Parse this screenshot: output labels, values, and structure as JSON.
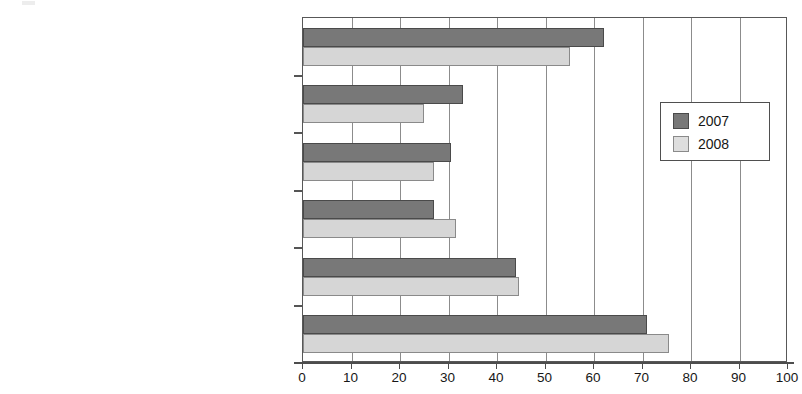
{
  "chart_data": {
    "type": "bar",
    "orientation": "horizontal",
    "title": "",
    "xlabel": "",
    "ylabel": "",
    "xlim": [
      0,
      100
    ],
    "xticks": [
      0,
      10,
      20,
      30,
      40,
      50,
      60,
      70,
      80,
      90,
      100
    ],
    "grid": "vertical",
    "legend_position": "upper right",
    "categories": [
      "Pro increasing private sector\ninvolvement in health care",
      "Pro privatization of Hydro Quebec",
      "Disagree with government intervention on\nissues related to the environment",
      "Disagree with government intervention on\nissues related to poverty",
      "Mean support for labour unions\n(on a 0 to 100 scale)",
      "Agree that government\n“wastes a lot of money”"
    ],
    "series": [
      {
        "name": "2007",
        "color": "#787878",
        "values": [
          62,
          33,
          30.5,
          27,
          44,
          71
        ]
      },
      {
        "name": "2008",
        "color": "#d6d6d6",
        "values": [
          55,
          25,
          27,
          31.5,
          44.5,
          75.5
        ]
      }
    ]
  },
  "legend": {
    "entries": [
      {
        "label": "2007",
        "swatch": "dark-gray-swatch"
      },
      {
        "label": "2008",
        "swatch": "light-gray-swatch"
      }
    ]
  }
}
